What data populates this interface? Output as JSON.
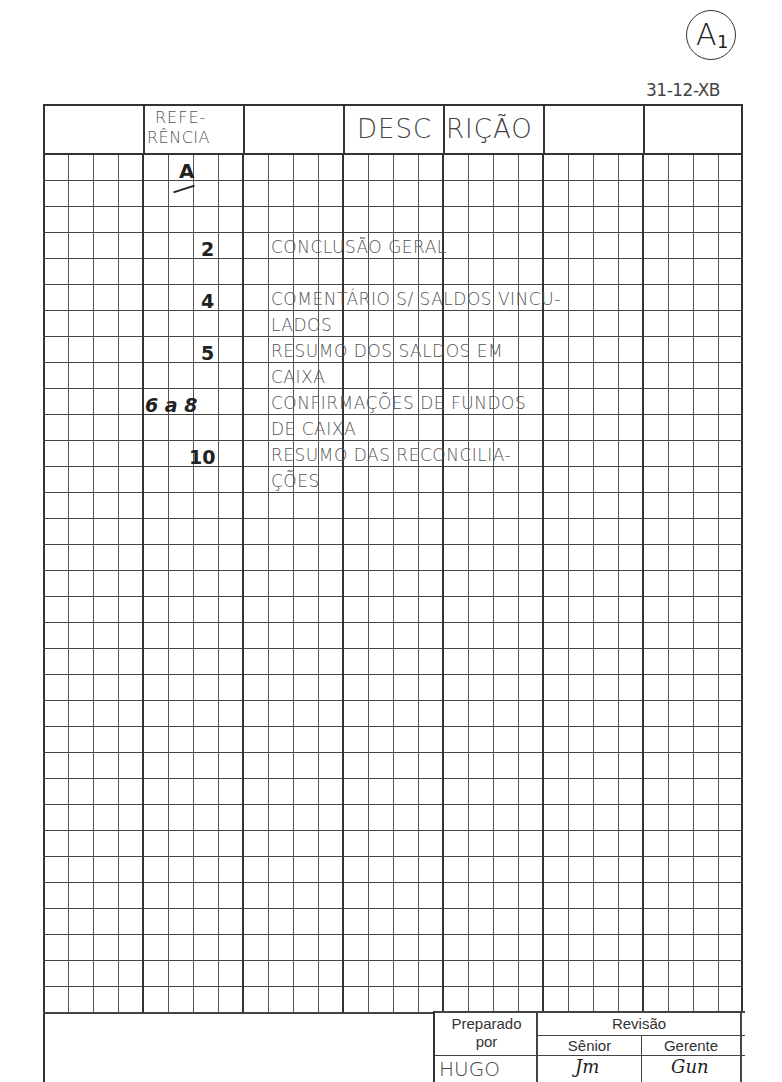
{
  "badge": {
    "letter": "A",
    "subscript": "1"
  },
  "document_code": "31-12-XB",
  "header": {
    "reference_line1": "REFE-",
    "reference_line2": "RÊNCIA",
    "description_part1": "DESC",
    "description_part2": "RIÇÃO"
  },
  "reference_section": "A",
  "entries": [
    {
      "ref": "2",
      "lines": [
        "CONCLUSÃO GERAL"
      ]
    },
    {
      "ref": "4",
      "lines": [
        "COMENTÁRIO S/ SALDOS VINCU-",
        "LADOS"
      ]
    },
    {
      "ref": "5",
      "lines": [
        "RESUMO DOS SALDOS EM",
        "CAIXA"
      ]
    },
    {
      "ref": "6 a 8",
      "lines": [
        "CONFIRMAÇÕES DE FUNDOS",
        "DE CAIXA"
      ]
    },
    {
      "ref": "10",
      "lines": [
        "RESUMO DAS RECONCILIA-",
        "ÇÕES"
      ]
    }
  ],
  "footer": {
    "prepared_label_line1": "Preparado",
    "prepared_label_line2": "por",
    "prepared_by": "HUGO",
    "review_label": "Revisão",
    "senior_label": "Sênior",
    "manager_label": "Gerente",
    "senior_signature": "Jm",
    "manager_signature": "Gun"
  }
}
